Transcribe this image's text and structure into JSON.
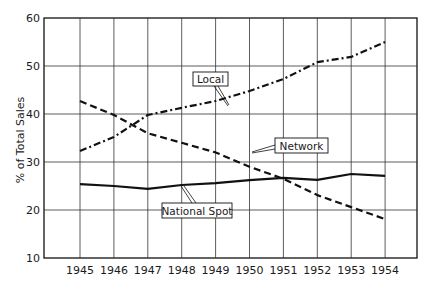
{
  "chart_data": {
    "type": "line",
    "title": "",
    "xlabel": "",
    "ylabel": "% of Total Sales",
    "x": [
      "1945",
      "1946",
      "1947",
      "1948",
      "1949",
      "1950",
      "1951",
      "1952",
      "1953",
      "1954"
    ],
    "ylim": [
      10,
      60
    ],
    "yticks": [
      10,
      20,
      30,
      40,
      50,
      60
    ],
    "grid": true,
    "legend": "inline labels",
    "series": [
      {
        "name": "Local",
        "style": "dash-dot",
        "values": [
          32.3,
          35.2,
          39.8,
          41.3,
          42.7,
          44.8,
          47.3,
          50.8,
          51.9,
          55.0
        ]
      },
      {
        "name": "Network",
        "style": "dashed",
        "values": [
          42.7,
          39.8,
          36.0,
          34.0,
          32.0,
          29.0,
          26.5,
          23.1,
          20.6,
          18.1
        ]
      },
      {
        "name": "National Spot",
        "style": "solid",
        "values": [
          25.4,
          25.0,
          24.4,
          25.2,
          25.6,
          26.2,
          26.7,
          26.3,
          27.5,
          27.1
        ]
      }
    ]
  },
  "labels": {
    "local": "Local",
    "network": "Network",
    "national_spot": "National Spot"
  },
  "axis": {
    "ylabel": "% of Total Sales",
    "yticks": [
      "10",
      "20",
      "30",
      "40",
      "50",
      "60"
    ],
    "xticks": [
      "1945",
      "1946",
      "1947",
      "1948",
      "1949",
      "1950",
      "1951",
      "1952",
      "1953",
      "1954"
    ]
  },
  "colors": {
    "line": "#111111",
    "grid": "#333333"
  }
}
